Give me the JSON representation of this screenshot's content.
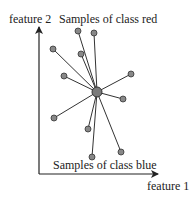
{
  "diagram": {
    "labels": {
      "y_axis": "feature 2",
      "x_axis": "feature 1",
      "top": "Samples of class red",
      "bottom": "Samples of class blue"
    },
    "colors": {
      "line": "#333333",
      "point_fill": "#888888",
      "point_stroke": "#333333",
      "center_fill": "#7a7a7a",
      "axis": "#222222"
    },
    "axes": {
      "origin": [
        39,
        174
      ],
      "y_tip": [
        39,
        27
      ],
      "x_tip": [
        158,
        174
      ]
    },
    "center": {
      "x": 97,
      "y": 92,
      "r": 5
    },
    "points": [
      {
        "x": 78,
        "y": 31
      },
      {
        "x": 94,
        "y": 33
      },
      {
        "x": 53,
        "y": 49
      },
      {
        "x": 81,
        "y": 54
      },
      {
        "x": 64,
        "y": 76
      },
      {
        "x": 131,
        "y": 74
      },
      {
        "x": 123,
        "y": 99
      },
      {
        "x": 54,
        "y": 118
      },
      {
        "x": 88,
        "y": 129
      },
      {
        "x": 92,
        "y": 157
      },
      {
        "x": 121,
        "y": 152
      }
    ]
  }
}
